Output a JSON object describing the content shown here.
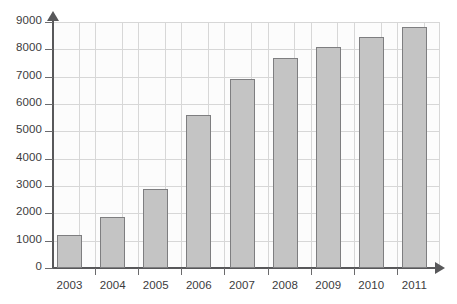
{
  "chart_data": {
    "type": "bar",
    "title": "",
    "subtitle": "",
    "xlabel": "",
    "ylabel": "",
    "categories": [
      "2003",
      "2004",
      "2005",
      "2006",
      "2007",
      "2008",
      "2009",
      "2010",
      "2011"
    ],
    "values": [
      1200,
      1850,
      2900,
      5600,
      6900,
      7700,
      8100,
      8450,
      8800
    ],
    "ylim": [
      0,
      9000
    ],
    "y_ticks": [
      0,
      1000,
      2000,
      3000,
      4000,
      5000,
      6000,
      7000,
      8000,
      9000
    ],
    "y_tick_labels": [
      "0",
      "1000",
      "2000",
      "3000",
      "4000",
      "5000",
      "6000",
      "7000",
      "8000",
      "9000"
    ],
    "grid": true,
    "grid_axis": "both",
    "legend": false,
    "legend_position": "none",
    "bar_fill_color": "#c4c4c4",
    "bar_edge_color": "#7e7e80",
    "axis_color": "#58585a",
    "grid_color": "#d7d7d7",
    "plot_background": "#fcfcfc",
    "series": [
      {
        "name": "",
        "values": [
          1200,
          1850,
          2900,
          5600,
          6900,
          7700,
          8100,
          8450,
          8800
        ]
      }
    ]
  }
}
